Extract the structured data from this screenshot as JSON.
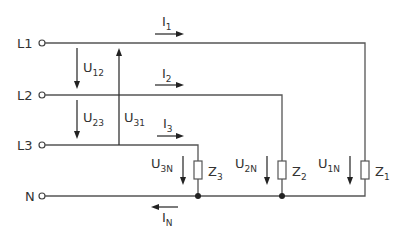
{
  "diagram": {
    "type": "three-phase four-wire star load circuit",
    "lines": [
      {
        "id": "L1",
        "label": "L1",
        "current": "I",
        "current_sub": "1"
      },
      {
        "id": "L2",
        "label": "L2",
        "current": "I",
        "current_sub": "2"
      },
      {
        "id": "L3",
        "label": "L3",
        "current": "I",
        "current_sub": "3"
      },
      {
        "id": "N",
        "label": "N",
        "current": "I",
        "current_sub": "N"
      }
    ],
    "line_voltages": [
      {
        "label": "U",
        "sub": "12"
      },
      {
        "label": "U",
        "sub": "23"
      },
      {
        "label": "U",
        "sub": "31"
      }
    ],
    "phase_voltages": [
      {
        "label": "U",
        "sub": "3N"
      },
      {
        "label": "U",
        "sub": "2N"
      },
      {
        "label": "U",
        "sub": "1N"
      }
    ],
    "impedances": [
      {
        "label": "Z",
        "sub": "3"
      },
      {
        "label": "Z",
        "sub": "2"
      },
      {
        "label": "Z",
        "sub": "1"
      }
    ]
  }
}
